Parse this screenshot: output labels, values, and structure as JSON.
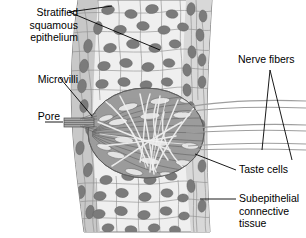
{
  "figure": {
    "type": "histology-diagram",
    "width": 306,
    "height": 238,
    "background_color": "#ffffff"
  },
  "labels": {
    "stratified_squamous_epithelium": "Stratified\nsquamous\nepithelium",
    "microvilli": "Microvilli",
    "pore": "Pore",
    "nerve_fibers": "Nerve fibers",
    "taste_cells": "Taste cells",
    "subepithelial_connective_tissue": "Subepithelial\nconnective\ntissue"
  },
  "colors": {
    "epithelium_fill": "#ececec",
    "epithelium_band": "#c8c8c8",
    "nucleus_fill": "#7d7d7d",
    "taste_bud_fill": "#9a9a9a",
    "taste_cell_light": "#e8e8e8",
    "nerve_fiber": "#d8d8d8",
    "outline": "#555555",
    "leader_line": "#000000",
    "pore_fill": "#a0a0a0",
    "connective_tissue": "#d5d5d5"
  },
  "structures": [
    {
      "name": "stratified-squamous-epithelium",
      "description": "Layered polygonal epithelial cells with dark oval nuclei forming a vertical column"
    },
    {
      "name": "taste-bud",
      "description": "Ovoid cluster of elongated taste cells spanning the epithelium"
    },
    {
      "name": "taste-pore",
      "description": "Small striped opening at the left apex of the taste bud"
    },
    {
      "name": "microvilli",
      "description": "Fine hair-like projections extending through the pore"
    },
    {
      "name": "nerve-fibers",
      "description": "Pale fibers weaving among taste cells and exiting to the right"
    },
    {
      "name": "subepithelial-connective-tissue",
      "description": "Vertical band of lighter tissue along the right margin of the epithelium"
    }
  ]
}
